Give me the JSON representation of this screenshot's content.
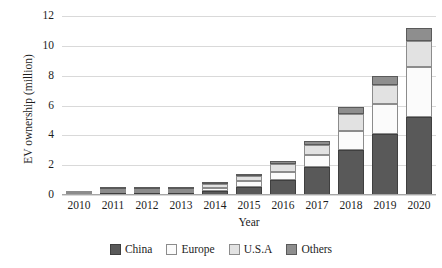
{
  "chart_data": {
    "type": "bar",
    "subtype": "stacked-bar",
    "title": "",
    "xlabel": "Year",
    "ylabel": "EV ownership (million)",
    "categories": [
      "2010",
      "2011",
      "2012",
      "2013",
      "2014",
      "2015",
      "2016",
      "2017",
      "2018",
      "2019",
      "2020"
    ],
    "yticks": [
      "0",
      "2",
      "4",
      "6",
      "8",
      "10",
      "12"
    ],
    "ylim": [
      0,
      12
    ],
    "grid": true,
    "legend_position": "bottom",
    "series": [
      {
        "name": "China",
        "color": "#595959",
        "values": [
          0.0,
          0.01,
          0.05,
          0.1,
          0.25,
          0.55,
          1.0,
          1.9,
          3.0,
          4.1,
          5.2
        ]
      },
      {
        "name": "Europe",
        "color": "#fbfbfb",
        "values": [
          0.01,
          0.02,
          0.05,
          0.15,
          0.25,
          0.4,
          0.55,
          0.8,
          1.3,
          2.0,
          3.4
        ]
      },
      {
        "name": "U.S.A",
        "color": "#e2e2e2",
        "values": [
          0.01,
          0.02,
          0.05,
          0.1,
          0.25,
          0.35,
          0.55,
          0.65,
          1.1,
          1.3,
          1.7
        ]
      },
      {
        "name": "Others",
        "color": "#8e8e8e",
        "values": [
          0.0,
          0.01,
          0.03,
          0.05,
          0.1,
          0.1,
          0.2,
          0.25,
          0.5,
          0.6,
          0.9
        ]
      }
    ],
    "totals": [
      0.02,
      0.06,
      0.18,
      0.4,
      0.85,
      1.4,
      2.3,
      3.6,
      5.9,
      8.0,
      11.2
    ]
  },
  "legend": {
    "items": [
      {
        "label": "China"
      },
      {
        "label": "Europe"
      },
      {
        "label": "U.S.A"
      },
      {
        "label": "Others"
      }
    ]
  },
  "axes": {
    "y_title": "EV ownership (million)",
    "x_title": "Year"
  }
}
